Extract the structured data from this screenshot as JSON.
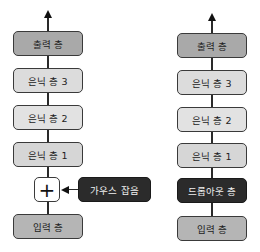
{
  "left_diagram": {
    "output_layer": "출력 층",
    "hidden_3": "은닉 층 3",
    "hidden_2": "은닉 층 2",
    "hidden_1": "은닉 층 1",
    "add_symbol": "+",
    "noise_label": "가우스 잡음",
    "input_layer": "입력 층"
  },
  "right_diagram": {
    "output_layer": "출력 층",
    "hidden_3": "은닉 층 3",
    "hidden_2": "은닉 층 2",
    "hidden_1": "은닉 층 1",
    "dropout_layer": "드롭아웃 층",
    "input_layer": "입력 층"
  },
  "colors": {
    "output": "#a9a9a9",
    "hidden": "#dcdcdc",
    "input": "#b5b5b5",
    "dark": "#2b2b2b"
  }
}
